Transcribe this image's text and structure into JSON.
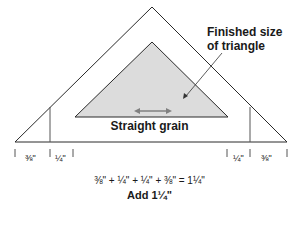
{
  "diagram": {
    "callout": {
      "line1": "Finished size",
      "line2": "of triangle"
    },
    "grain_label": "Straight grain",
    "measurements": {
      "left_outer": "⅜\"",
      "left_inner": "¼\"",
      "right_inner": "¼\"",
      "right_outer": "⅜\""
    },
    "equation": "⅜\" + ¼\" + ¼\" + ⅜\" = 1¼\"",
    "result": "Add 1¼\"",
    "colors": {
      "line": "#2a2a2a",
      "fill": "#dcdcdc",
      "arrow": "#808080"
    }
  }
}
